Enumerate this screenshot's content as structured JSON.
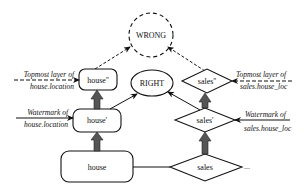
{
  "diagram": {
    "nodes": {
      "wrong": {
        "label": "WRONG",
        "shape": "dashed-circle"
      },
      "right": {
        "label": "RIGHT",
        "shape": "ellipse"
      },
      "house2": {
        "label": "house''",
        "shape": "rounded-rect"
      },
      "house1": {
        "label": "house'",
        "shape": "rounded-rect"
      },
      "house0": {
        "label": "house",
        "shape": "rounded-rect"
      },
      "sales2": {
        "label": "sales''",
        "shape": "diamond"
      },
      "sales1": {
        "label": "sales'",
        "shape": "diamond"
      },
      "sales0": {
        "label": "sales",
        "shape": "diamond"
      }
    },
    "annotations": {
      "left_top_1": "Topmost layer of",
      "left_top_2": "house.location",
      "left_wm_1": "Watermark of",
      "left_wm_2": "house.location",
      "right_top_1": "Topmost layer of",
      "right_top_2": "sales.house_loc",
      "right_wm_1": "Watermark of",
      "right_wm_2": "sales.house_loc",
      "ellipsis": "..."
    }
  }
}
